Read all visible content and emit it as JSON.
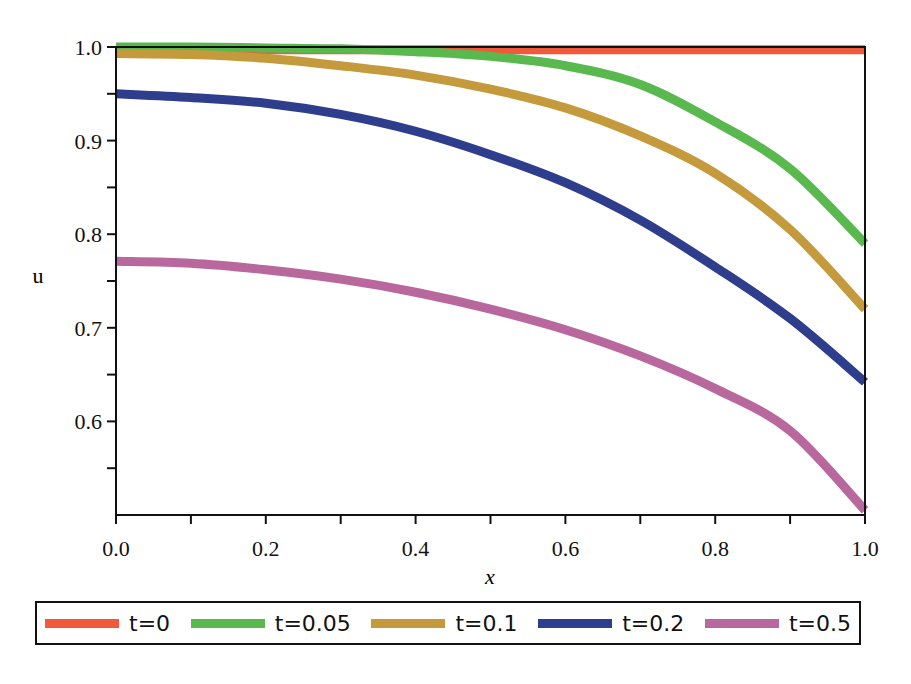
{
  "chart_data": {
    "type": "line",
    "title": "",
    "xlabel": "x",
    "ylabel": "u",
    "xlim": [
      0.0,
      1.0
    ],
    "ylim": [
      0.5,
      1.0
    ],
    "grid": false,
    "legend_position": "bottom",
    "x_ticks": [
      "0.0",
      "0.2",
      "0.4",
      "0.6",
      "0.8",
      "1.0"
    ],
    "y_ticks": [
      "0.6",
      "0.7",
      "0.8",
      "0.9",
      "1.0"
    ],
    "x": [
      0.0,
      0.1,
      0.2,
      0.3,
      0.4,
      0.5,
      0.6,
      0.7,
      0.8,
      0.9,
      1.0
    ],
    "series": [
      {
        "name": "t=0",
        "color": "#f05a3a",
        "values": [
          0.997,
          0.997,
          0.997,
          0.997,
          0.997,
          0.997,
          0.997,
          0.997,
          0.997,
          0.997,
          0.997
        ]
      },
      {
        "name": "t=0.05",
        "color": "#5ab94e",
        "values": [
          1.0,
          1.0,
          0.999,
          0.998,
          0.995,
          0.99,
          0.98,
          0.96,
          0.92,
          0.87,
          0.79
        ]
      },
      {
        "name": "t=0.1",
        "color": "#c49a3c",
        "values": [
          0.993,
          0.992,
          0.988,
          0.98,
          0.97,
          0.955,
          0.935,
          0.905,
          0.865,
          0.805,
          0.72
        ]
      },
      {
        "name": "t=0.2",
        "color": "#2e3e8c",
        "values": [
          0.95,
          0.946,
          0.94,
          0.928,
          0.91,
          0.885,
          0.855,
          0.815,
          0.765,
          0.71,
          0.642
        ]
      },
      {
        "name": "t=0.5",
        "color": "#b9689e",
        "values": [
          0.771,
          0.769,
          0.762,
          0.752,
          0.738,
          0.72,
          0.698,
          0.67,
          0.635,
          0.59,
          0.505
        ]
      }
    ]
  },
  "legend": {
    "items": [
      {
        "label": "t=0",
        "color": "#f05a3a"
      },
      {
        "label": "t=0.05",
        "color": "#5ab94e"
      },
      {
        "label": "t=0.1",
        "color": "#c49a3c"
      },
      {
        "label": "t=0.2",
        "color": "#2e3e8c"
      },
      {
        "label": "t=0.5",
        "color": "#b9689e"
      }
    ]
  }
}
